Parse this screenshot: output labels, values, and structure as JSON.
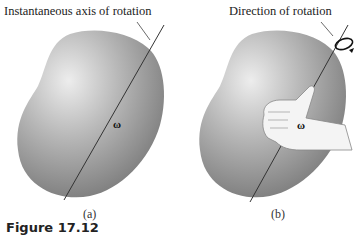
{
  "figure": {
    "caption": "Figure 17.12",
    "panels": [
      {
        "id": "a",
        "sublabel": "(a)",
        "callout": "Instantaneous axis of rotation",
        "vector_label": "ω"
      },
      {
        "id": "b",
        "sublabel": "(b)",
        "callout": "Direction of rotation",
        "vector_label": "ω"
      }
    ],
    "colors": {
      "body_light": "#e6e6e6",
      "body_mid": "#a9a9a9",
      "body_dark": "#7d7d7d",
      "line": "#333333",
      "text": "#222222"
    }
  }
}
